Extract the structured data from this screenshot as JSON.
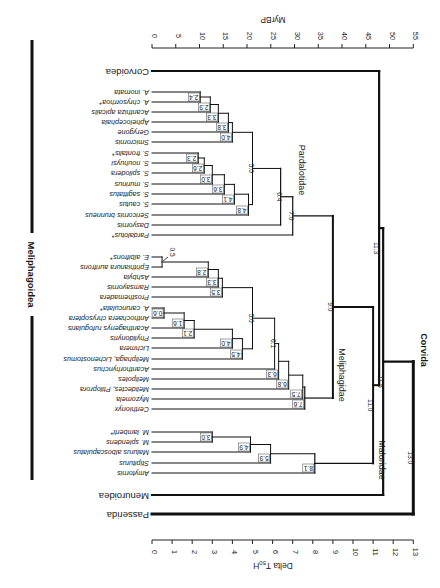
{
  "figure": {
    "rotation_deg": 180,
    "width": 440,
    "height": 588
  },
  "chart_data": {
    "type": "dendrogram",
    "title": "",
    "orientation": "rotated 180 degrees (upside-down)",
    "x_axis_bottom": {
      "label": "Delta T50H",
      "label_main": "Delta T",
      "label_sub": "50",
      "label_tail": "H",
      "range": [
        0,
        13
      ],
      "ticks": [
        "0",
        "1",
        "2",
        "3",
        "4",
        "5",
        "6",
        "7",
        "8",
        "9",
        "10",
        "11",
        "12",
        "13"
      ]
    },
    "x_axis_top": {
      "label": "MyrBP",
      "range": [
        0,
        55
      ],
      "ticks": [
        "0",
        "5",
        "10",
        "15",
        "20",
        "25",
        "30",
        "35",
        "40",
        "45",
        "50",
        "55"
      ]
    },
    "taxa": [
      {
        "id": "corvoidea",
        "label": "Corvoidea",
        "y": 71,
        "style": "roman"
      },
      {
        "id": "a_inornata",
        "label": "A. inornata",
        "y": 92
      },
      {
        "id": "a_chrysorrhoa",
        "label": "A. chrysorrhoa*",
        "y": 102
      },
      {
        "id": "acanthiza_apicalis",
        "label": "Acanthiza apicalis",
        "y": 112
      },
      {
        "id": "aphelocephala",
        "label": "Aphelocephala",
        "y": 122
      },
      {
        "id": "gerygone",
        "label": "Gerygone",
        "y": 132
      },
      {
        "id": "smicrornis",
        "label": "Smicrornis",
        "y": 142
      },
      {
        "id": "s_frontalis",
        "label": "S. frontalis*",
        "y": 153
      },
      {
        "id": "s_nouhuysi",
        "label": "S. nouhuysi",
        "y": 163
      },
      {
        "id": "s_spilodera",
        "label": "S. spilodera",
        "y": 173
      },
      {
        "id": "s_murinus",
        "label": "S. murinus",
        "y": 184
      },
      {
        "id": "s_sagittatus",
        "label": "S. sagittatus",
        "y": 194
      },
      {
        "id": "s_cautus",
        "label": "S. cautus",
        "y": 204
      },
      {
        "id": "sericornis_brunneus",
        "label": "Sericornis brunneus",
        "y": 215
      },
      {
        "id": "dasyornis",
        "label": "Dasyornis",
        "y": 225
      },
      {
        "id": "pardalotus",
        "label": "Pardalotus*",
        "y": 235
      },
      {
        "id": "e_albifrons",
        "label": "E. albifrons*",
        "y": 257
      },
      {
        "id": "ephthianura_aurifrons",
        "label": "Ephthianura aurifrons",
        "y": 267
      },
      {
        "id": "ashbyia",
        "label": "Ashbyia",
        "y": 277
      },
      {
        "id": "ramsayornis",
        "label": "Ramsayornis",
        "y": 287
      },
      {
        "id": "prosthemadera",
        "label": "Prosthemadera",
        "y": 297
      },
      {
        "id": "a_carunculata",
        "label": "A. carunculata*",
        "y": 308
      },
      {
        "id": "anthochaera_chrysoptera",
        "label": "Anthochaera chrysoptera",
        "y": 318
      },
      {
        "id": "acanthagenys_rufogularis",
        "label": "Acanthagenys rufogularis",
        "y": 328
      },
      {
        "id": "phylidonyris",
        "label": "Phylidonyris",
        "y": 338
      },
      {
        "id": "lichmera",
        "label": "Lichmera",
        "y": 348
      },
      {
        "id": "meliphaga_lichenostomus",
        "label": "Meliphaga, Lichenostomus",
        "y": 359
      },
      {
        "id": "acanthorhynchus",
        "label": "Acanthorhynchus",
        "y": 369
      },
      {
        "id": "melipotes",
        "label": "Melipotes",
        "y": 379
      },
      {
        "id": "melidectes_ptiloprora",
        "label": "Melidectes, Ptiloprora",
        "y": 389
      },
      {
        "id": "myzomela",
        "label": "Myzomela",
        "y": 399
      },
      {
        "id": "certhionyx",
        "label": "Certhionyx",
        "y": 409
      },
      {
        "id": "m_lamberti",
        "label": "M. lamberti*",
        "y": 432
      },
      {
        "id": "m_splendens",
        "label": "M. splendens",
        "y": 442
      },
      {
        "id": "malurus_alboscapulatus",
        "label": "Malurus alboscapulatus",
        "y": 452
      },
      {
        "id": "stipiturus",
        "label": "Stipiturus",
        "y": 463
      },
      {
        "id": "amytornis",
        "label": "Amytornis",
        "y": 473
      },
      {
        "id": "menuroidea",
        "label": "Menuroidea",
        "y": 495,
        "style": "roman"
      },
      {
        "id": "passerida",
        "label": "Passerida",
        "y": 514,
        "style": "roman"
      }
    ],
    "nodes": [
      {
        "id": "n24",
        "value": 2.4,
        "label": "2.4",
        "children": [
          "a_inornata",
          "a_chrysorrhoa"
        ],
        "w": 1
      },
      {
        "id": "n29",
        "value": 2.9,
        "label": "2.9",
        "children": [
          "n24",
          "acanthiza_apicalis"
        ],
        "w": 1
      },
      {
        "id": "n33a",
        "value": 3.3,
        "label": "3.3",
        "children": [
          "n29",
          "aphelocephala"
        ],
        "w": 1
      },
      {
        "id": "n38",
        "value": 3.8,
        "label": "3.8",
        "children": [
          "n33a",
          "gerygone"
        ],
        "w": 1
      },
      {
        "id": "n40a",
        "value": 4.0,
        "label": "4.0",
        "children": [
          "n38",
          "smicrornis"
        ],
        "w": 1
      },
      {
        "id": "n23",
        "value": 2.3,
        "label": "2.3",
        "children": [
          "s_frontalis",
          "s_nouhuysi"
        ],
        "w": 1
      },
      {
        "id": "n26",
        "value": 2.6,
        "label": "2.6",
        "children": [
          "n23",
          "s_spilodera"
        ],
        "w": 1
      },
      {
        "id": "n30a",
        "value": 3.0,
        "label": "3.0",
        "children": [
          "n26",
          "s_murinus"
        ],
        "w": 1
      },
      {
        "id": "n36",
        "value": 3.6,
        "label": "3.6",
        "children": [
          "n30a",
          "s_sagittatus"
        ],
        "w": 1
      },
      {
        "id": "n41",
        "value": 4.1,
        "label": "4.1",
        "children": [
          "n36",
          "s_cautus"
        ],
        "w": 1
      },
      {
        "id": "n48",
        "value": 4.8,
        "label": "4.8",
        "children": [
          "n41",
          "sericornis_brunneus"
        ],
        "w": 1
      },
      {
        "id": "n50a",
        "value": 5.0,
        "label": "5.0",
        "children": [
          "n40a",
          "n48"
        ],
        "w": 1
      },
      {
        "id": "n64",
        "value": 6.4,
        "label": "6.4",
        "children": [
          "n50a",
          "dasyornis"
        ],
        "w": 1.2
      },
      {
        "id": "n70",
        "value": 7.0,
        "label": "7.0",
        "children": [
          "n64",
          "pardalotus"
        ],
        "w": 1.2
      },
      {
        "id": "n05",
        "value": 0.5,
        "label": "0.5",
        "children": [
          "e_albifrons",
          "ephthianura_aurifrons"
        ],
        "w": 1
      },
      {
        "id": "n28",
        "value": 2.8,
        "label": "2.8",
        "children": [
          "n05",
          "ashbyia"
        ],
        "w": 1
      },
      {
        "id": "n33b",
        "value": 3.3,
        "label": "3.3",
        "children": [
          "n28",
          "ramsayornis"
        ],
        "w": 1
      },
      {
        "id": "n35",
        "value": 3.5,
        "label": "3.5",
        "children": [
          "n33b",
          "prosthemadera"
        ],
        "w": 1
      },
      {
        "id": "n06",
        "value": 0.6,
        "label": "0.6",
        "children": [
          "a_carunculata",
          "anthochaera_chrysoptera"
        ],
        "w": 1
      },
      {
        "id": "n16",
        "value": 1.6,
        "label": "1.6",
        "children": [
          "n06",
          "acanthagenys_rufogularis"
        ],
        "w": 1
      },
      {
        "id": "n21",
        "value": 2.1,
        "label": "2.1",
        "children": [
          "n16",
          "phylidonyris"
        ],
        "w": 1
      },
      {
        "id": "n40b",
        "value": 4.0,
        "label": "4.0",
        "children": [
          "n21",
          "lichmera"
        ],
        "w": 1
      },
      {
        "id": "n45",
        "value": 4.5,
        "label": "4.5",
        "children": [
          "n40b",
          "meliphaga_lichenostomus"
        ],
        "w": 1
      },
      {
        "id": "n50b",
        "value": 5.0,
        "label": "5.0",
        "children": [
          "n35",
          "n45"
        ],
        "w": 1
      },
      {
        "id": "n61",
        "value": 6.1,
        "label": "6.1",
        "children": [
          "n50b",
          "acanthorhynchus"
        ],
        "w": 1
      },
      {
        "id": "n63",
        "value": 6.3,
        "label": "6.3",
        "children": [
          "n61",
          "melipotes"
        ],
        "w": 1
      },
      {
        "id": "n68",
        "value": 6.8,
        "label": "6.8",
        "children": [
          "n63",
          "melidectes_ptiloprora"
        ],
        "w": 1
      },
      {
        "id": "n75",
        "value": 7.5,
        "label": "7.5",
        "children": [
          "n68",
          "myzomela"
        ],
        "w": 1
      },
      {
        "id": "n76",
        "value": 7.6,
        "label": "7.6",
        "children": [
          "n75",
          "certhionyx"
        ],
        "w": 1.2
      },
      {
        "id": "n90",
        "value": 9.0,
        "label": "9.0",
        "children": [
          "n70",
          "n76"
        ],
        "w": 2
      },
      {
        "id": "n30b",
        "value": 3.0,
        "label": "3.0",
        "children": [
          "m_lamberti",
          "m_splendens"
        ],
        "w": 1
      },
      {
        "id": "n49",
        "value": 4.9,
        "label": "4.9",
        "children": [
          "n30b",
          "malurus_alboscapulatus"
        ],
        "w": 1
      },
      {
        "id": "n59",
        "value": 5.9,
        "label": "5.9",
        "children": [
          "n49",
          "stipiturus"
        ],
        "w": 1
      },
      {
        "id": "n81",
        "value": 8.1,
        "label": "8.1",
        "children": [
          "n59",
          "amytornis"
        ],
        "w": 1.2
      },
      {
        "id": "n110",
        "value": 11.0,
        "label": "11.0",
        "children": [
          "n90",
          "n81"
        ],
        "w": 2
      },
      {
        "id": "n113",
        "value": 11.3,
        "label": "11.3",
        "children": [
          "corvoidea",
          "n110"
        ],
        "w": 2.2
      },
      {
        "id": "n115",
        "value": 11.5,
        "label": "11.5",
        "children": [
          "n113",
          "menuroidea"
        ],
        "w": 2.2
      },
      {
        "id": "n130",
        "value": 13.0,
        "label": "13.0",
        "children": [
          "n115",
          "passerida"
        ],
        "w": 3
      }
    ],
    "clade_labels": [
      {
        "text": "Pardalotidae",
        "value": 7.3,
        "y": 170
      },
      {
        "text": "Meliphagidae",
        "value": 9.3,
        "y": 375
      },
      {
        "text": "Maluridae",
        "value": 11.3,
        "y": 460
      },
      {
        "text": "Corvida",
        "value": 13.4,
        "y": 350,
        "bold": true
      }
    ],
    "brackets": [
      {
        "label": "Meliphagoidea",
        "y1": 40,
        "y2": 233,
        "y3": 316,
        "y4": 480
      }
    ],
    "annotations": [
      "* (asterisk) marks selected taxa",
      "arrow pointing to node 0.5"
    ]
  }
}
